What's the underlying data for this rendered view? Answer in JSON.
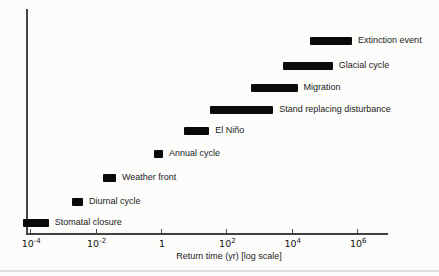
{
  "chart_data": {
    "type": "bar",
    "subtype": "horizontal-interval",
    "title": "",
    "xlabel": "Return time (yr) [log scale]",
    "ylabel": "",
    "x_axis": {
      "label": "Return time (yr) [log scale]",
      "scale": "log",
      "ticks": [
        {
          "base": "10",
          "exp": "-4"
        },
        {
          "base": "10",
          "exp": "-2"
        },
        {
          "base": "1",
          "exp": ""
        },
        {
          "base": "10",
          "exp": "2"
        },
        {
          "base": "10",
          "exp": "4"
        },
        {
          "base": "10",
          "exp": "6"
        }
      ],
      "tick_values": [
        0.0001,
        0.01,
        1,
        100,
        10000,
        1000000
      ],
      "range_displayed_yr": [
        7e-05,
        9000000
      ]
    },
    "grid": false,
    "legend": "none",
    "bar_color": "#0a0a0a",
    "events": [
      {
        "label": "Extinction event",
        "start_yr": 36000,
        "end_yr": 700000
      },
      {
        "label": "Glacial cycle",
        "start_yr": 5400,
        "end_yr": 180000
      },
      {
        "label": "Migration",
        "start_yr": 560,
        "end_yr": 15000
      },
      {
        "label": "Stand replacing disturbance",
        "start_yr": 32,
        "end_yr": 2700
      },
      {
        "label": "El Niño",
        "start_yr": 5,
        "end_yr": 30
      },
      {
        "label": "Annual cycle",
        "start_yr": 0.6,
        "end_yr": 1.15
      },
      {
        "label": "Weather front",
        "start_yr": 0.017,
        "end_yr": 0.042
      },
      {
        "label": "Diurnal cycle",
        "start_yr": 0.0019,
        "end_yr": 0.0041
      },
      {
        "label": "Stomatal closure",
        "start_yr": 6e-05,
        "end_yr": 0.00037
      }
    ]
  }
}
